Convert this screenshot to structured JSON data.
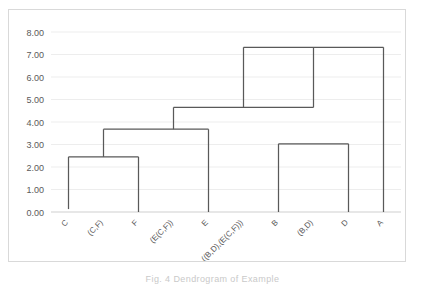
{
  "figure": {
    "caption": "Fig. 4  Dendrogram of Example",
    "frame_color": "#d9d9d9",
    "background": "#ffffff"
  },
  "chart_data": {
    "type": "line",
    "chart_kind": "dendrogram",
    "title": "",
    "xlabel": "",
    "ylabel": "",
    "ylim": [
      0.0,
      8.0
    ],
    "grid": true,
    "grid_color": "#ededed",
    "line_color": "#595959",
    "legend": "none",
    "y_ticks": [
      0.0,
      1.0,
      2.0,
      3.0,
      4.0,
      5.0,
      6.0,
      7.0,
      8.0
    ],
    "y_tick_labels": [
      "0.00",
      "1.00",
      "2.00",
      "3.00",
      "4.00",
      "5.00",
      "6.00",
      "7.00",
      "8.00"
    ],
    "x_tick_labels": [
      "C",
      "(C,F)",
      "F",
      "(E(C,F))",
      "E",
      "((B,D),(E(C,F)))",
      "B",
      "(B,D)",
      "D",
      "A"
    ],
    "leaves": [
      {
        "name": "C",
        "x_slot": 0,
        "stem_base": 0.13
      },
      {
        "name": "F",
        "x_slot": 2,
        "stem_base": 0.0
      },
      {
        "name": "E",
        "x_slot": 4,
        "stem_base": 0.0
      },
      {
        "name": "B",
        "x_slot": 6,
        "stem_base": 0.0
      },
      {
        "name": "D",
        "x_slot": 8,
        "stem_base": 0.0
      },
      {
        "name": "A",
        "x_slot": 9,
        "stem_base": 0.0
      }
    ],
    "merges": [
      {
        "label": "(C,F)",
        "height": 2.45,
        "left_slot": 0,
        "right_slot": 2,
        "node_slot": 1
      },
      {
        "label": "(B,D)",
        "height": 3.03,
        "left_slot": 6,
        "right_slot": 8,
        "node_slot": 7
      },
      {
        "label": "(E(C,F))",
        "height": 3.68,
        "left_slot": 1,
        "right_slot": 4,
        "node_slot": 3
      },
      {
        "label": "((B,D),(E(C,F)))",
        "height": 4.65,
        "left_slot": 3,
        "right_slot": 7,
        "node_slot": 5
      },
      {
        "label": "root",
        "height": 7.32,
        "left_slot": 5,
        "right_slot": 9,
        "node_slot": 7
      }
    ]
  }
}
